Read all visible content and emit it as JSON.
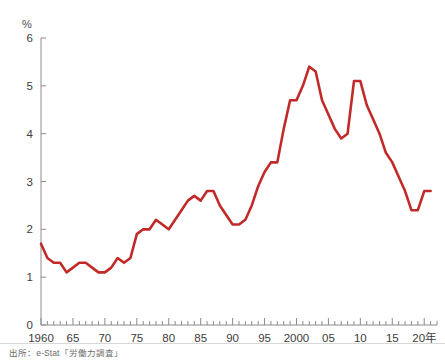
{
  "chart_data": {
    "type": "line",
    "title": "",
    "subtitle": "",
    "xlabel": "",
    "ylabel": "%",
    "unit_label": "%",
    "x_axis_suffix": "年",
    "xlim": [
      1960,
      2022
    ],
    "ylim": [
      0,
      6
    ],
    "y_ticks": [
      "0",
      "1",
      "2",
      "3",
      "4",
      "5",
      "6"
    ],
    "y_tick_values": [
      0,
      1,
      2,
      3,
      4,
      5,
      6
    ],
    "x_ticks": [
      "1960",
      "65",
      "70",
      "75",
      "80",
      "85",
      "90",
      "95",
      "2000",
      "05",
      "10",
      "15",
      "20年"
    ],
    "x_tick_values": [
      1960,
      1965,
      1970,
      1975,
      1980,
      1985,
      1990,
      1995,
      2000,
      2005,
      2010,
      2015,
      2020
    ],
    "grid": false,
    "legend": null,
    "legend_position": "none",
    "minor_ticks_every": 1,
    "series": [
      {
        "name": "完全失業率",
        "color": "#c22a2a",
        "x": [
          1960,
          1961,
          1962,
          1963,
          1964,
          1965,
          1966,
          1967,
          1968,
          1969,
          1970,
          1971,
          1972,
          1973,
          1974,
          1975,
          1976,
          1977,
          1978,
          1979,
          1980,
          1981,
          1982,
          1983,
          1984,
          1985,
          1986,
          1987,
          1988,
          1989,
          1990,
          1991,
          1992,
          1993,
          1994,
          1995,
          1996,
          1997,
          1998,
          1999,
          2000,
          2001,
          2002,
          2003,
          2004,
          2005,
          2006,
          2007,
          2008,
          2009,
          2010,
          2011,
          2012,
          2013,
          2014,
          2015,
          2016,
          2017,
          2018,
          2019,
          2020,
          2021
        ],
        "values": [
          1.7,
          1.4,
          1.3,
          1.3,
          1.1,
          1.2,
          1.3,
          1.3,
          1.2,
          1.1,
          1.1,
          1.2,
          1.4,
          1.3,
          1.4,
          1.9,
          2.0,
          2.0,
          2.2,
          2.1,
          2.0,
          2.2,
          2.4,
          2.6,
          2.7,
          2.6,
          2.8,
          2.8,
          2.5,
          2.3,
          2.1,
          2.1,
          2.2,
          2.5,
          2.9,
          3.2,
          3.4,
          3.4,
          4.1,
          4.7,
          4.7,
          5.0,
          5.4,
          5.3,
          4.7,
          4.4,
          4.1,
          3.9,
          4.0,
          5.1,
          5.1,
          4.6,
          4.3,
          4.0,
          3.6,
          3.4,
          3.1,
          2.8,
          2.4,
          2.4,
          2.8,
          2.8
        ],
        "line_width": 2.6
      }
    ],
    "annotations": [],
    "peaks": [
      {
        "year": 2002,
        "value": 5.4
      },
      {
        "year": 2009,
        "value": 5.1
      }
    ],
    "troughs": [
      {
        "year": 1964,
        "value": 1.1
      },
      {
        "year": 1970,
        "value": 1.1
      }
    ]
  },
  "footer": {
    "source_note": "出所：e-Stat「労働力調査」"
  },
  "colors": {
    "line": "#c22a2a",
    "axis": "#8c8c8c",
    "tick_text": "#3c3c3c",
    "background": "#ffffff",
    "source_text": "#6b6b6b"
  }
}
